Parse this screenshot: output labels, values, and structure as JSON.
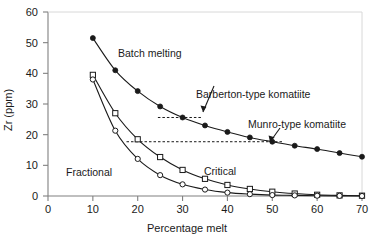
{
  "figure": {
    "background": "#ffffff",
    "axis_color": "#808080",
    "line_color": "#1a1a1a"
  },
  "axes": {
    "y_title": "Zr (ppm)",
    "x_title": "Percentage melt",
    "y_ticks": [
      "0",
      "10",
      "20",
      "30",
      "40",
      "50",
      "60"
    ],
    "x_ticks": [
      "0",
      "10",
      "20",
      "30",
      "40",
      "50",
      "60",
      "70"
    ]
  },
  "annotations": {
    "batch_melting": "Batch melting",
    "barberton": "Barberton-type komatiite",
    "munro": "Munro-type komatiite",
    "fractional": "Fractional",
    "critical": "Critical"
  },
  "chart_data": {
    "type": "line",
    "title": "",
    "xlabel": "Percentage melt",
    "ylabel": "Zr (ppm)",
    "xlim": [
      0,
      70
    ],
    "ylim": [
      0,
      60
    ],
    "xticks": [
      0,
      10,
      20,
      30,
      40,
      50,
      60,
      70
    ],
    "yticks": [
      0,
      10,
      20,
      30,
      40,
      50,
      60
    ],
    "grid": false,
    "legend": "inline-annotations",
    "series": [
      {
        "name": "Batch melting",
        "marker": "filled-circle",
        "x": [
          10,
          15,
          20,
          25,
          30,
          35,
          40,
          45,
          50,
          55,
          60,
          65,
          70
        ],
        "y": [
          51.5,
          41.0,
          34.2,
          29.2,
          25.6,
          23.0,
          20.9,
          19.1,
          17.7,
          16.4,
          15.3,
          14.0,
          12.8
        ]
      },
      {
        "name": "Critical",
        "marker": "open-square",
        "x": [
          10,
          15,
          20,
          25,
          30,
          35,
          40,
          45,
          50,
          55,
          60,
          65,
          70
        ],
        "y": [
          39.5,
          27.0,
          18.5,
          12.7,
          8.5,
          5.6,
          3.6,
          2.3,
          1.4,
          0.8,
          0.4,
          0.2,
          0.1
        ]
      },
      {
        "name": "Fractional",
        "marker": "open-circle",
        "x": [
          10,
          15,
          20,
          25,
          30,
          35,
          40,
          45,
          50,
          55,
          60,
          65,
          70
        ],
        "y": [
          38.0,
          21.3,
          12.1,
          6.8,
          3.8,
          2.1,
          1.1,
          0.6,
          0.3,
          0.2,
          0.1,
          0.05,
          0.0
        ]
      }
    ],
    "reference_lines": [
      {
        "label": "Barberton-type komatiite",
        "y": 25.6,
        "x_start": 24.5,
        "x_end": 34.5,
        "style": "dashed"
      },
      {
        "label": "Munro-type komatiite",
        "y": 17.7,
        "x_start": 17.5,
        "x_end": 52.5,
        "style": "dashed"
      }
    ],
    "pointers": [
      {
        "label": "Barberton-type komatiite",
        "x": 30,
        "y": 25.6
      },
      {
        "label": "Munro-type komatiite",
        "x": 50,
        "y": 17.7
      }
    ]
  }
}
